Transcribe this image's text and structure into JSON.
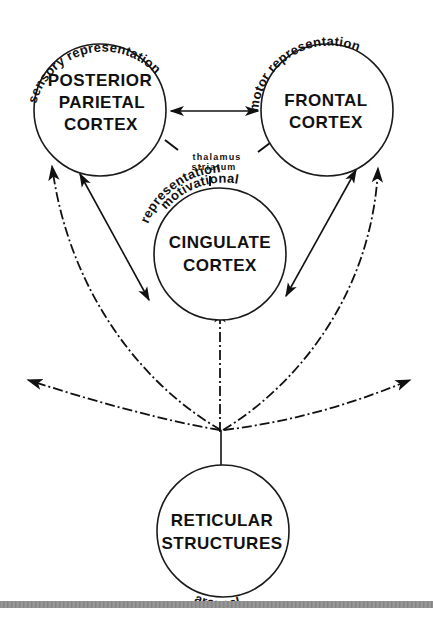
{
  "diagram": {
    "nodes": [
      {
        "id": "posterior_parietal",
        "lines": [
          "POSTERIOR",
          "PARIETAL",
          "CORTEX"
        ],
        "arc_label": "sensory representation"
      },
      {
        "id": "frontal",
        "lines": [
          "FRONTAL",
          "CORTEX"
        ],
        "arc_label": "motor representation"
      },
      {
        "id": "cingulate",
        "lines": [
          "CINGULATE",
          "CORTEX"
        ],
        "arc_label_lines": [
          "motivational",
          "representation"
        ]
      },
      {
        "id": "reticular",
        "lines": [
          "RETICULAR",
          "STRUCTURES"
        ],
        "arc_label": "arousal"
      }
    ],
    "hub": {
      "lines": [
        "thalamus",
        "striatum"
      ]
    },
    "edges": [
      {
        "from": "posterior_parietal",
        "to": "frontal",
        "style": "solid",
        "direction": "both"
      },
      {
        "from": "posterior_parietal",
        "to": "cingulate",
        "style": "solid",
        "direction": "both"
      },
      {
        "from": "frontal",
        "to": "cingulate",
        "style": "solid",
        "direction": "both"
      },
      {
        "from": "hub",
        "to": "posterior_parietal",
        "style": "line"
      },
      {
        "from": "hub",
        "to": "frontal",
        "style": "line"
      },
      {
        "from": "hub",
        "to": "cingulate",
        "style": "line"
      },
      {
        "from": "reticular",
        "to": "posterior_parietal",
        "style": "dash-dot",
        "direction": "forward"
      },
      {
        "from": "reticular",
        "to": "frontal",
        "style": "dash-dot",
        "direction": "forward"
      },
      {
        "from": "reticular",
        "to": "cingulate",
        "style": "dash-dot",
        "direction": "forward"
      },
      {
        "from": "reticular",
        "to": "left-diffuse",
        "style": "dash-dot",
        "direction": "forward"
      },
      {
        "from": "reticular",
        "to": "right-diffuse",
        "style": "dash-dot",
        "direction": "forward"
      }
    ],
    "colors": {
      "ink": "#111111",
      "background": "#ffffff",
      "bar": "#8a8a8a"
    }
  }
}
